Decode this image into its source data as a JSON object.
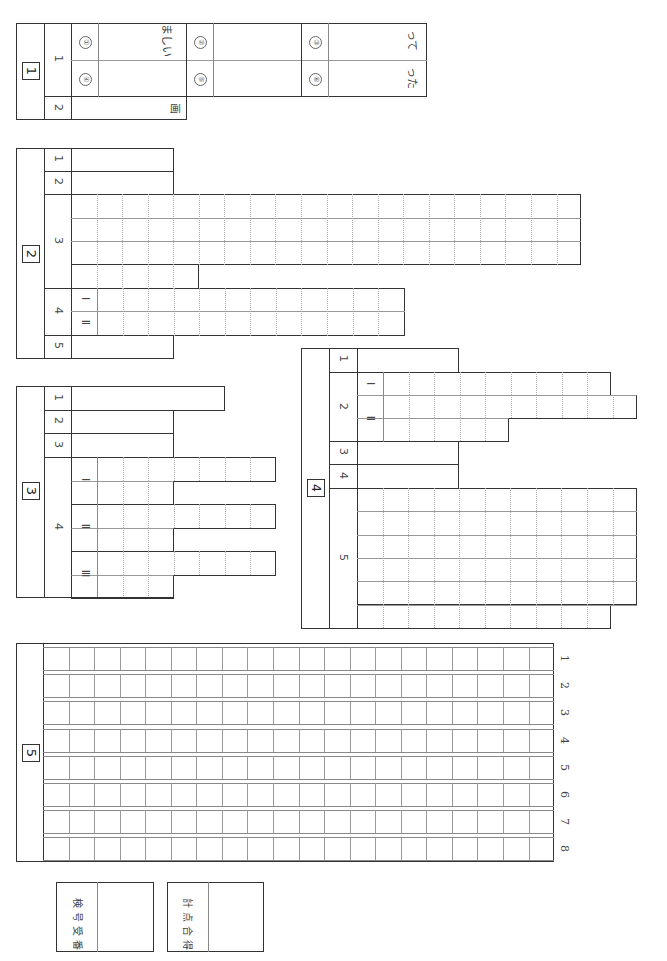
{
  "sheet": {
    "orientation": "rotated-90",
    "sections": [
      {
        "id": "1",
        "label": "1",
        "questions": [
          {
            "num": "1",
            "items": [
              {
                "marker": "①",
                "text": "ましい"
              },
              {
                "marker": "②",
                "text": ""
              },
              {
                "marker": "③",
                "text": "って"
              },
              {
                "marker": "④",
                "text": ""
              },
              {
                "marker": "⑤",
                "text": ""
              },
              {
                "marker": "⑥",
                "text": "った"
              }
            ]
          },
          {
            "num": "2",
            "text": "画"
          }
        ]
      },
      {
        "id": "2",
        "label": "2",
        "questions": [
          {
            "num": "1"
          },
          {
            "num": "2"
          },
          {
            "num": "3",
            "rows": 4
          },
          {
            "num": "4",
            "parts": [
              "Ⅰ",
              "Ⅱ"
            ]
          },
          {
            "num": "5"
          }
        ]
      },
      {
        "id": "3",
        "label": "3",
        "questions": [
          {
            "num": "1"
          },
          {
            "num": "2"
          },
          {
            "num": "3"
          },
          {
            "num": "4",
            "parts": [
              "Ⅰ",
              "Ⅱ",
              "Ⅲ"
            ]
          }
        ]
      },
      {
        "id": "4",
        "label": "4",
        "questions": [
          {
            "num": "1"
          },
          {
            "num": "2",
            "parts": [
              "Ⅰ",
              "Ⅱ"
            ]
          },
          {
            "num": "3"
          },
          {
            "num": "4"
          },
          {
            "num": "5",
            "rows": 6
          }
        ]
      },
      {
        "id": "5",
        "label": "5",
        "row_numbers": [
          "1",
          "2",
          "3",
          "4",
          "5",
          "6",
          "7",
          "8"
        ]
      }
    ],
    "footer": {
      "exam_number_label": [
        "受",
        "検",
        "番",
        "号"
      ],
      "exam_number_text_a": "受番",
      "exam_number_text_b": "検号",
      "total_score_text_a": "合得",
      "total_score_text_b": "計点",
      "exam_number_value": "",
      "total_score_value": ""
    }
  }
}
